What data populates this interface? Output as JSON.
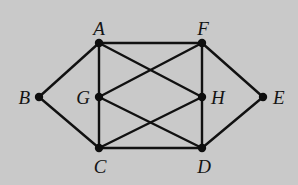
{
  "diagram": {
    "type": "undirected-graph",
    "nodes": [
      {
        "id": "A",
        "label": "A"
      },
      {
        "id": "B",
        "label": "B"
      },
      {
        "id": "C",
        "label": "C"
      },
      {
        "id": "D",
        "label": "D"
      },
      {
        "id": "E",
        "label": "E"
      },
      {
        "id": "F",
        "label": "F"
      },
      {
        "id": "G",
        "label": "G"
      },
      {
        "id": "H",
        "label": "H"
      }
    ],
    "edges": [
      [
        "A",
        "F"
      ],
      [
        "A",
        "B"
      ],
      [
        "A",
        "G"
      ],
      [
        "G",
        "C"
      ],
      [
        "A",
        "H"
      ],
      [
        "F",
        "G"
      ],
      [
        "F",
        "H"
      ],
      [
        "H",
        "D"
      ],
      [
        "F",
        "E"
      ],
      [
        "B",
        "C"
      ],
      [
        "G",
        "D"
      ],
      [
        "C",
        "H"
      ],
      [
        "C",
        "D"
      ],
      [
        "D",
        "E"
      ]
    ]
  },
  "colors": {
    "background": "#c9c9c9",
    "ink": "#111111"
  }
}
